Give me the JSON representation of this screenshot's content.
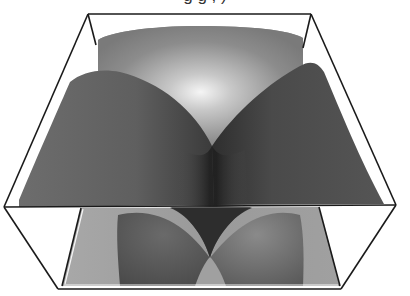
{
  "figure": {
    "title_partial": "g g , )",
    "title_note": "title text clipped at top edge; only descenders visible",
    "type": "3d-surface-plot",
    "rendering": "grayscale shaded surface inside wireframe bounding box"
  },
  "colors": {
    "background": "#ffffff",
    "box_line": "#1a1a1a",
    "surface_dark": "#3a3a3a",
    "surface_mid": "#6e6e6e",
    "surface_light": "#9a9a9a",
    "highlight": "#f4f4f4",
    "floor_light": "#a6a6a6",
    "floor_dark": "#555555"
  },
  "box": {
    "top_back_left": [
      88,
      14
    ],
    "top_back_right": [
      311,
      14
    ],
    "mid_left": [
      4,
      207
    ],
    "mid_right": [
      396,
      205
    ],
    "bottom_front_left": [
      58,
      289
    ],
    "bottom_front_right": [
      341,
      289
    ]
  }
}
